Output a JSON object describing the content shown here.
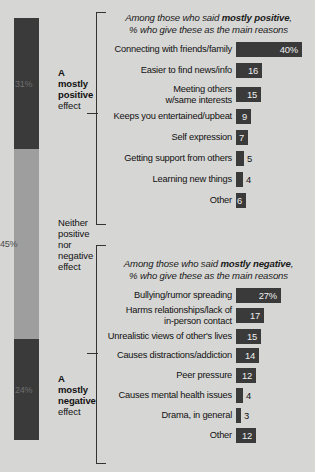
{
  "chart_data": {
    "type": "bar",
    "title": "",
    "stacked_bar": {
      "orientation": "vertical",
      "segments": [
        {
          "label_line1": "A mostly",
          "label_line2": "positive",
          "label_line3": "effect",
          "bold_line": 2,
          "value": 31,
          "value_label": "31%",
          "color": "#3a3a3a"
        },
        {
          "label_line1": "Neither",
          "label_line2": "positive",
          "label_line3": "nor",
          "label_line4": "negative",
          "label_line5": "effect",
          "bold_line": 0,
          "value": 45,
          "value_label": "45%",
          "color": "#9e9e9e"
        },
        {
          "label_line1": "A mostly",
          "label_line2": "negative",
          "label_line3": "effect",
          "bold_line": 2,
          "value": 24,
          "value_label": "24%",
          "color": "#3a3a3a"
        }
      ]
    },
    "panels": [
      {
        "head_pre": "Among those who said ",
        "head_bold": "mostly positive",
        "head_post": ",",
        "head_line2": "% who give these as the main reasons",
        "xmax": 42,
        "categories": [
          "Connecting with friends/family",
          "Easier to find news/info",
          "Meeting others\nw/same interests",
          "Keeps you entertained/upbeat",
          "Self expression",
          "Getting support from others",
          "Learning new things",
          "Other"
        ],
        "values": [
          40,
          16,
          15,
          9,
          7,
          5,
          4,
          6
        ],
        "value_labels": [
          "40%",
          "16",
          "15",
          "9",
          "7",
          "5",
          "4",
          "6"
        ],
        "label_inside": [
          true,
          true,
          true,
          true,
          true,
          false,
          false,
          true
        ]
      },
      {
        "head_pre": "Among those who said ",
        "head_bold": "mostly negative",
        "head_post": ",",
        "head_line2": "% who give these as the main reasons",
        "xmax": 42,
        "categories": [
          "Bullying/rumor spreading",
          "Harms relationships/lack of\nin-person contact",
          "Unrealistic views of other's lives",
          "Causes distractions/addiction",
          "Peer pressure",
          "Causes mental health issues",
          "Drama, in general",
          "Other"
        ],
        "values": [
          27,
          17,
          15,
          14,
          12,
          4,
          3,
          12
        ],
        "value_labels": [
          "27%",
          "17",
          "15",
          "14",
          "12",
          "4",
          "3",
          "12"
        ],
        "label_inside": [
          true,
          true,
          true,
          true,
          true,
          false,
          false,
          true
        ]
      }
    ],
    "colors": {
      "background": "#d6d6d4",
      "bar": "#3a3a3a",
      "bar_mid": "#9e9e9e",
      "text": "#111111"
    }
  }
}
